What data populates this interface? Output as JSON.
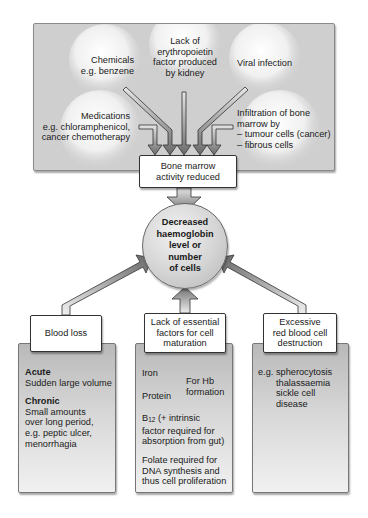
{
  "diagram": {
    "top_causes": {
      "chemicals": {
        "title": "Chemicals",
        "example": "e.g. benzene"
      },
      "erythropoietin": {
        "line1": "Lack of",
        "line2": "erythropoietin",
        "line3": "factor produced",
        "line4": "by kidney"
      },
      "viral": {
        "title": "Viral infection"
      },
      "medications": {
        "title": "Medications",
        "example1": "e.g. chloramphenicol,",
        "example2": "cancer chemotherapy"
      },
      "infiltration": {
        "line1": "Infiltration of bone",
        "line2": "marrow by",
        "line3": "– tumour cells (cancer)",
        "line4": "– fibrous cells"
      }
    },
    "bone_marrow_box": {
      "line1": "Bone marrow",
      "line2": "activity reduced"
    },
    "central_outcome": {
      "line1": "Decreased",
      "line2": "haemoglobin",
      "line3": "level or",
      "line4": "number",
      "line5": "of cells"
    },
    "bottom_causes": {
      "blood_loss": {
        "title": "Blood loss",
        "acute_heading": "Acute",
        "acute_text": "Sudden large volume",
        "chronic_heading": "Chronic",
        "chronic_line1": "Small amounts",
        "chronic_line2": "over long period,",
        "chronic_line3": "e.g. peptic ulcer,",
        "chronic_line4": "menorrhagia"
      },
      "essential_factors": {
        "title_line1": "Lack of essential",
        "title_line2": "factors for cell",
        "title_line3": "maturation",
        "iron": "Iron",
        "protein": "Protein",
        "hb_line1": "For Hb",
        "hb_line2": "formation",
        "b12_prefix": "B",
        "b12_sub": "12",
        "b12_line1": " (+ intrinsic",
        "b12_line2": "factor required for",
        "b12_line3": "absorption from gut)",
        "folate_line1": "Folate required  for",
        "folate_line2": "DNA synthesis and",
        "folate_line3": "thus cell proliferation"
      },
      "rbc_destruction": {
        "title_line1": "Excessive",
        "title_line2": "red blood cell",
        "title_line3": "destruction",
        "eg": "e.g.",
        "item1": "spherocytosis",
        "item2": "thalassaemia",
        "item3": "sickle cell",
        "item4": "disease"
      }
    },
    "colors": {
      "panel_gray": "#cfcfcf",
      "arrow_dark": "#6e6e6e",
      "arrow_light": "#d8d8d8",
      "border": "#333333"
    }
  }
}
